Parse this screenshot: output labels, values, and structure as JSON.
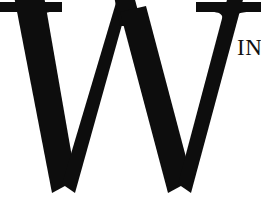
{
  "image": {
    "kind": "logo-wordmark-crop",
    "width": 261,
    "height": 197,
    "background_color": "#ffffff",
    "ink_color": "#0d0d0d"
  },
  "wordmark": {
    "primary_glyph": "W",
    "primary_glyph_description": "large bold serif capital W, cropped at top, left and bottom edges",
    "secondary_text": "IN",
    "secondary_text_description": "small serif capitals to the right of the W, clipped by the right edge",
    "typeface_style": "serif"
  }
}
